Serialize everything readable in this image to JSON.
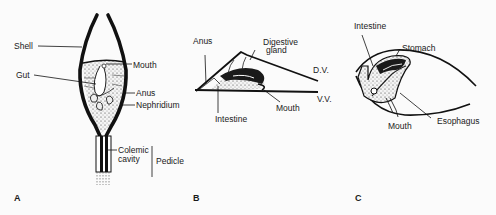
{
  "figure": {
    "panels": [
      {
        "id": "A",
        "letter": "A",
        "labels": {
          "shell": "Shell",
          "gut": "Gut",
          "mouth": "Mouth",
          "anus": "Anus",
          "nephridium": "Nephridium",
          "colemic_line1": "Colemic",
          "colemic_line2": "cavity",
          "pedicle": "Pedicle"
        }
      },
      {
        "id": "B",
        "letter": "B",
        "labels": {
          "anus": "Anus",
          "digestive_line1": "Digestive",
          "digestive_line2": "gland",
          "dv": "D.V.",
          "vv": "V.V.",
          "mouth": "Mouth",
          "intestine": "Intestine"
        }
      },
      {
        "id": "C",
        "letter": "C",
        "labels": {
          "intestine": "Intestine",
          "stomach": "Stomach",
          "mouth": "Mouth",
          "esophagus": "Esophagus"
        }
      }
    ]
  }
}
